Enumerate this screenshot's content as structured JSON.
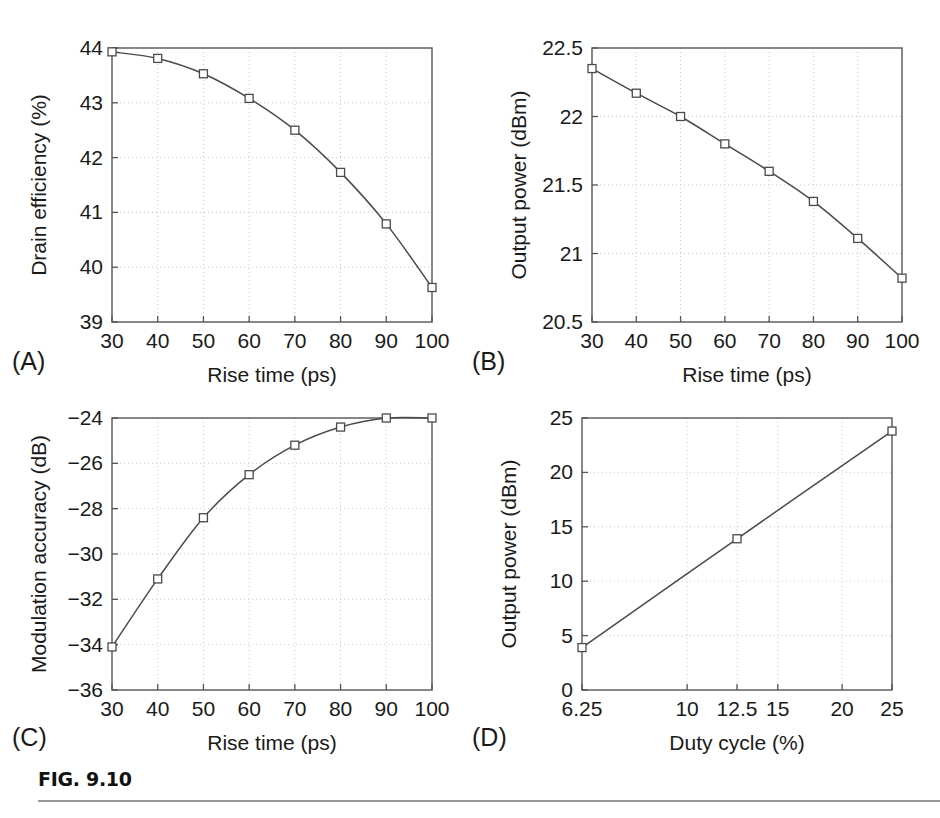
{
  "figure": {
    "caption_label": "FIG. 9.10"
  },
  "panels": [
    {
      "letter": "(A)",
      "xlabel": "Rise time (ps)",
      "ylabel": "Drain efficiency (%)",
      "xticks": [
        "30",
        "40",
        "50",
        "60",
        "70",
        "80",
        "90",
        "100"
      ],
      "yticks": [
        "39",
        "40",
        "41",
        "42",
        "43",
        "44"
      ]
    },
    {
      "letter": "(B)",
      "xlabel": "Rise time (ps)",
      "ylabel": "Output power (dBm)",
      "xticks": [
        "30",
        "40",
        "50",
        "60",
        "70",
        "80",
        "90",
        "100"
      ],
      "yticks": [
        "20.5",
        "21",
        "21.5",
        "22",
        "22.5"
      ]
    },
    {
      "letter": "(C)",
      "xlabel": "Rise time (ps)",
      "ylabel": "Modulation accuracy (dB)",
      "xticks": [
        "30",
        "40",
        "50",
        "60",
        "70",
        "80",
        "90",
        "100"
      ],
      "yticks": [
        "−36",
        "−34",
        "−32",
        "−30",
        "−28",
        "−26",
        "−24"
      ]
    },
    {
      "letter": "(D)",
      "xlabel": "Duty cycle (%)",
      "ylabel": "Output power (dBm)",
      "xticks": [
        "6.25",
        "10",
        "12.5",
        "15",
        "20",
        "25"
      ],
      "yticks": [
        "0",
        "5",
        "10",
        "15",
        "20",
        "25"
      ]
    }
  ],
  "chart_data": [
    {
      "type": "line",
      "panel": "A",
      "title": "",
      "xlabel": "Rise time (ps)",
      "ylabel": "Drain efficiency (%)",
      "x": [
        30,
        40,
        50,
        60,
        70,
        80,
        90,
        100
      ],
      "values": [
        43.93,
        43.81,
        43.53,
        43.08,
        42.5,
        41.73,
        40.79,
        39.63
      ],
      "xtick_values": [
        30,
        40,
        50,
        60,
        70,
        80,
        90,
        100
      ],
      "ytick_values": [
        39,
        40,
        41,
        42,
        43,
        44
      ],
      "xlim": [
        30,
        100
      ],
      "ylim": [
        39,
        44
      ],
      "xscale": "linear",
      "yscale": "linear",
      "grid": true,
      "legend": null,
      "marker": "open-square"
    },
    {
      "type": "line",
      "panel": "B",
      "title": "",
      "xlabel": "Rise time (ps)",
      "ylabel": "Output power (dBm)",
      "x": [
        30,
        40,
        50,
        60,
        70,
        80,
        90,
        100
      ],
      "values": [
        22.35,
        22.17,
        22.0,
        21.8,
        21.6,
        21.38,
        21.11,
        20.82
      ],
      "xtick_values": [
        30,
        40,
        50,
        60,
        70,
        80,
        90,
        100
      ],
      "ytick_values": [
        20.5,
        21,
        21.5,
        22,
        22.5
      ],
      "xlim": [
        30,
        100
      ],
      "ylim": [
        20.5,
        22.5
      ],
      "xscale": "linear",
      "yscale": "linear",
      "grid": true,
      "legend": null,
      "marker": "open-square"
    },
    {
      "type": "line",
      "panel": "C",
      "title": "",
      "xlabel": "Rise time (ps)",
      "ylabel": "Modulation accuracy (dB)",
      "x": [
        30,
        40,
        50,
        60,
        70,
        80,
        90,
        100
      ],
      "values": [
        -34.1,
        -31.1,
        -28.4,
        -26.5,
        -25.2,
        -24.4,
        -24.0,
        -24.0
      ],
      "xtick_values": [
        30,
        40,
        50,
        60,
        70,
        80,
        90,
        100
      ],
      "ytick_values": [
        -36,
        -34,
        -32,
        -30,
        -28,
        -26,
        -24
      ],
      "xlim": [
        30,
        100
      ],
      "ylim": [
        -36,
        -24
      ],
      "xscale": "linear",
      "yscale": "linear",
      "grid": true,
      "legend": null,
      "marker": "open-square"
    },
    {
      "type": "line",
      "panel": "D",
      "title": "",
      "xlabel": "Duty cycle (%)",
      "ylabel": "Output power (dBm)",
      "x": [
        6.25,
        12.5,
        25
      ],
      "values": [
        3.9,
        13.9,
        23.8
      ],
      "xtick_values": [
        6.25,
        10,
        12.5,
        15,
        20,
        25
      ],
      "ytick_values": [
        0,
        5,
        10,
        15,
        20,
        25
      ],
      "xlim": [
        6.25,
        25
      ],
      "ylim": [
        0,
        25
      ],
      "xscale": "log",
      "yscale": "linear",
      "grid": true,
      "legend": null,
      "marker": "open-square"
    }
  ]
}
